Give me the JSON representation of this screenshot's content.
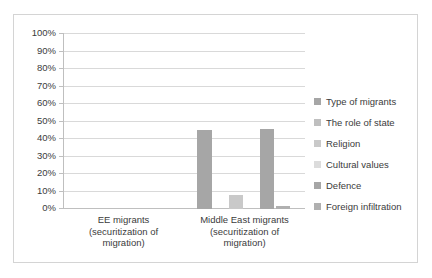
{
  "chart_data": {
    "type": "bar",
    "title": "",
    "xlabel": "",
    "ylabel": "",
    "grid": true,
    "legend_position": "right",
    "ylim": [
      0,
      100
    ],
    "ytick_labels": [
      "100%",
      "90%",
      "80%",
      "70%",
      "60%",
      "50%",
      "40%",
      "30%",
      "20%",
      "10%",
      "0%"
    ],
    "ytick_values": [
      100,
      90,
      80,
      70,
      60,
      50,
      40,
      30,
      20,
      10,
      0
    ],
    "categories": [
      "EE migrants\n(securitization of\nmigration)",
      "Middle East migrants\n(securitization of\nmigration)"
    ],
    "series": [
      {
        "name": "Type of migrants",
        "color": "#a6a6a6",
        "values": [
          0,
          45
        ]
      },
      {
        "name": "The role of state",
        "color": "#bfbfbf",
        "values": [
          0,
          0
        ]
      },
      {
        "name": "Religion",
        "color": "#c9c9c9",
        "values": [
          0,
          8
        ]
      },
      {
        "name": "Cultural values",
        "color": "#dcdcdc",
        "values": [
          0,
          0
        ]
      },
      {
        "name": "Defence",
        "color": "#a6a6a6",
        "values": [
          0,
          46
        ]
      },
      {
        "name": "Foreign infiltration",
        "color": "#b0b0b0",
        "values": [
          0,
          2
        ]
      }
    ]
  }
}
